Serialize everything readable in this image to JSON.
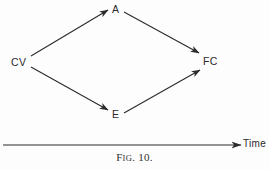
{
  "figure": {
    "caption_prefix": "F",
    "caption_smallcaps": "IG",
    "caption_suffix": ". 10.",
    "caption_full": "Fig. 10.",
    "background_color": "#fdfdfd",
    "ink_color": "#2b2b2b"
  },
  "diagram": {
    "type": "directed-graph",
    "nodes": [
      {
        "id": "CV",
        "label": "CV",
        "x": 22,
        "y": 62
      },
      {
        "id": "A",
        "label": "A",
        "x": 117,
        "y": 9
      },
      {
        "id": "E",
        "label": "E",
        "x": 117,
        "y": 114
      },
      {
        "id": "FC",
        "label": "FC",
        "x": 210,
        "y": 61
      }
    ],
    "edges": [
      {
        "from": "CV",
        "to": "A",
        "x1": 31,
        "y1": 56,
        "x2": 108,
        "y2": 10
      },
      {
        "from": "CV",
        "to": "E",
        "x1": 31,
        "y1": 67,
        "x2": 108,
        "y2": 110
      },
      {
        "from": "A",
        "to": "FC",
        "x1": 124,
        "y1": 12,
        "x2": 199,
        "y2": 53
      },
      {
        "from": "E",
        "to": "FC",
        "x1": 124,
        "y1": 113,
        "x2": 200,
        "y2": 70
      }
    ]
  },
  "axis": {
    "label": "Time",
    "line": {
      "x1": 3,
      "y1": 145,
      "x2": 241,
      "y2": 145
    },
    "arrow": true
  }
}
